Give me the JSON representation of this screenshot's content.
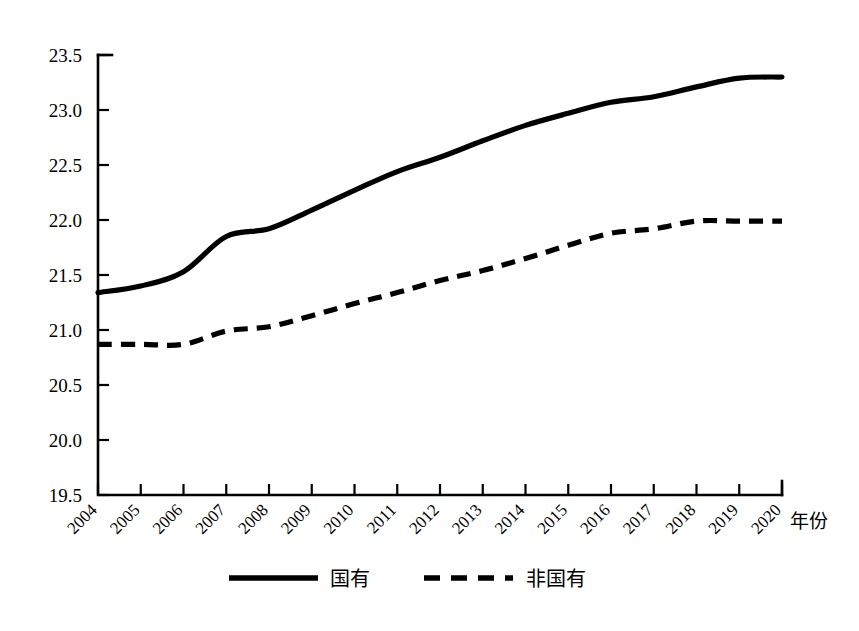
{
  "chart_data": {
    "type": "line",
    "title": "",
    "subtitle": "",
    "xlabel": "年份",
    "ylabel": "",
    "x": [
      2004,
      2005,
      2006,
      2007,
      2008,
      2009,
      2010,
      2011,
      2012,
      2013,
      2014,
      2015,
      2016,
      2017,
      2018,
      2019,
      2020
    ],
    "categories": [
      "2004",
      "2005",
      "2006",
      "2007",
      "2008",
      "2009",
      "2010",
      "2011",
      "2012",
      "2013",
      "2014",
      "2015",
      "2016",
      "2017",
      "2018",
      "2019",
      "2020"
    ],
    "series": [
      {
        "name": "国有",
        "style": "solid",
        "color": "#000000",
        "values": [
          21.34,
          21.4,
          21.53,
          21.85,
          21.92,
          22.09,
          22.27,
          22.44,
          22.57,
          22.72,
          22.86,
          22.97,
          23.07,
          23.12,
          23.21,
          23.29,
          23.3
        ]
      },
      {
        "name": "非国有",
        "style": "dashed",
        "color": "#000000",
        "values": [
          20.87,
          20.87,
          20.87,
          20.99,
          21.03,
          21.13,
          21.24,
          21.34,
          21.45,
          21.54,
          21.65,
          21.77,
          21.88,
          21.92,
          21.99,
          21.99,
          21.99
        ]
      }
    ],
    "ylim": [
      19.5,
      23.5
    ],
    "yticks": [
      19.5,
      20.0,
      20.5,
      21.0,
      21.5,
      22.0,
      22.5,
      23.0,
      23.5
    ],
    "ytick_labels": [
      "19.5",
      "20.0",
      "20.5",
      "21.0",
      "21.5",
      "22.0",
      "22.5",
      "23.0",
      "23.5"
    ],
    "xlim": [
      2004,
      2020
    ],
    "grid": false,
    "legend_position": "bottom"
  },
  "legend": {
    "entries": [
      {
        "label": "国有",
        "style": "solid"
      },
      {
        "label": "非国有",
        "style": "dashed"
      }
    ]
  },
  "axis": {
    "x_title": "年份"
  }
}
